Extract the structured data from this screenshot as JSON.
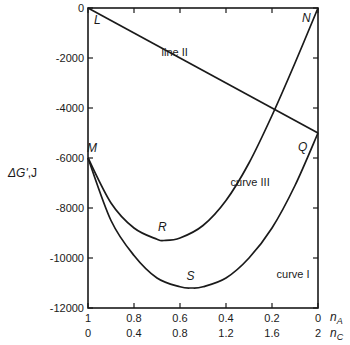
{
  "chart_data": {
    "type": "line",
    "title": "",
    "ylabel": "ΔG', J",
    "ylabel_parts": {
      "symbol": "ΔG'",
      "unit": ",J"
    },
    "xlabel_primary": "n_A",
    "xlabel_secondary": "n_C",
    "xlabel_primary_parts": {
      "base": "n",
      "sub": "A"
    },
    "xlabel_secondary_parts": {
      "base": "n",
      "sub": "C"
    },
    "ylim": [
      -12000,
      0
    ],
    "xlim_primary": [
      1,
      0
    ],
    "xlim_secondary": [
      0,
      2
    ],
    "yticks": [
      0,
      -2000,
      -4000,
      -6000,
      -8000,
      -10000,
      -12000
    ],
    "ytick_labels": [
      "0",
      "-2000",
      "-4000",
      "-6000",
      "-8000",
      "-10000",
      "-12000"
    ],
    "xticks_primary": [
      1,
      0.8,
      0.6,
      0.4,
      0.2,
      0
    ],
    "xtick_labels_primary": [
      "1",
      "0.8",
      "0.6",
      "0.4",
      "0.2",
      "0"
    ],
    "xticks_secondary": [
      0,
      0.4,
      0.8,
      1.2,
      1.6,
      2
    ],
    "xtick_labels_secondary": [
      "0",
      "0.4",
      "0.8",
      "1.2",
      "1.6",
      "2"
    ],
    "grid": false,
    "legend": null,
    "series": [
      {
        "name": "line II",
        "x_nA": [
          1,
          0
        ],
        "values": [
          0,
          -5000
        ]
      },
      {
        "name": "curve III",
        "x_nA": [
          1,
          0.9,
          0.8,
          0.7,
          0.67,
          0.6,
          0.5,
          0.4,
          0.3,
          0.2,
          0.1,
          0
        ],
        "values": [
          -6000,
          -7800,
          -8800,
          -9250,
          -9300,
          -9200,
          -8700,
          -7700,
          -6200,
          -4300,
          -2200,
          0
        ]
      },
      {
        "name": "curve I",
        "x_nA": [
          1,
          0.9,
          0.8,
          0.7,
          0.6,
          0.55,
          0.5,
          0.4,
          0.3,
          0.2,
          0.1,
          0
        ],
        "values": [
          -6000,
          -8500,
          -9900,
          -10800,
          -11150,
          -11200,
          -11150,
          -10800,
          -10000,
          -8800,
          -7100,
          -5000
        ]
      }
    ],
    "annotations": [
      {
        "text": "L",
        "x_nA": 1,
        "y": 0
      },
      {
        "text": "M",
        "x_nA": 1,
        "y": -6000
      },
      {
        "text": "N",
        "x_nA": 0,
        "y": 0
      },
      {
        "text": "Q",
        "x_nA": 0,
        "y": -5000
      },
      {
        "text": "R",
        "x_nA": 0.67,
        "y": -9300
      },
      {
        "text": "S",
        "x_nA": 0.55,
        "y": -11200
      },
      {
        "text": "line II",
        "x_nA": 0.68,
        "y": -1900
      },
      {
        "text": "curve III",
        "x_nA": 0.38,
        "y": -7100
      },
      {
        "text": "curve I",
        "x_nA": 0.18,
        "y": -10800
      }
    ]
  },
  "labels": {
    "L": "L",
    "M": "M",
    "N": "N",
    "Q": "Q",
    "R": "R",
    "S": "S",
    "line_II": "line II",
    "curve_III": "curve III",
    "curve_I": "curve I"
  }
}
